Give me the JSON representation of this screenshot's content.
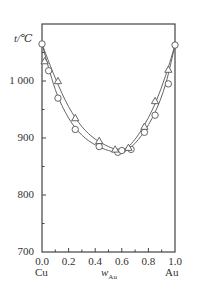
{
  "chart_data": {
    "type": "line",
    "title": "",
    "ylabel": "t/℃",
    "xlabel": "w_Au",
    "xlabel_main": "w",
    "xlabel_sub": "Au",
    "x_end_labels": {
      "left": "Cu",
      "right": "Au"
    },
    "xlim": [
      0.0,
      1.0
    ],
    "ylim": [
      700,
      1100
    ],
    "x_ticks": [
      "0.0",
      "0.2",
      "0.4",
      "0.6",
      "0.8",
      "1.0"
    ],
    "y_ticks": [
      "700",
      "800",
      "900",
      "1 000"
    ],
    "grid": false,
    "legend": null,
    "series": [
      {
        "name": "circles",
        "marker": "circle",
        "points": [
          [
            0.0,
            1065
          ],
          [
            0.05,
            1018
          ],
          [
            0.12,
            970
          ],
          [
            0.25,
            915
          ],
          [
            0.43,
            885
          ],
          [
            0.57,
            875
          ],
          [
            0.6,
            878
          ],
          [
            0.67,
            880
          ],
          [
            0.77,
            910
          ],
          [
            0.85,
            940
          ],
          [
            0.95,
            995
          ],
          [
            1.0,
            1063
          ]
        ],
        "curve": [
          [
            0.0,
            1065
          ],
          [
            0.1,
            985
          ],
          [
            0.2,
            935
          ],
          [
            0.3,
            905
          ],
          [
            0.4,
            888
          ],
          [
            0.5,
            878
          ],
          [
            0.58,
            875
          ],
          [
            0.65,
            880
          ],
          [
            0.75,
            905
          ],
          [
            0.85,
            945
          ],
          [
            0.93,
            995
          ],
          [
            1.0,
            1063
          ]
        ]
      },
      {
        "name": "triangles",
        "marker": "triangle",
        "points": [
          [
            0.02,
            1035
          ],
          [
            0.12,
            1000
          ],
          [
            0.25,
            935
          ],
          [
            0.43,
            895
          ],
          [
            0.55,
            880
          ],
          [
            0.65,
            883
          ],
          [
            0.77,
            920
          ],
          [
            0.85,
            965
          ],
          [
            0.95,
            1020
          ]
        ],
        "curve": [
          [
            0.0,
            1065
          ],
          [
            0.1,
            1005
          ],
          [
            0.2,
            955
          ],
          [
            0.3,
            920
          ],
          [
            0.4,
            898
          ],
          [
            0.5,
            885
          ],
          [
            0.57,
            880
          ],
          [
            0.65,
            885
          ],
          [
            0.75,
            915
          ],
          [
            0.85,
            960
          ],
          [
            0.93,
            1010
          ],
          [
            1.0,
            1063
          ]
        ]
      }
    ]
  }
}
